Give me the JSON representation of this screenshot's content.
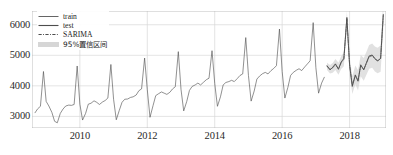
{
  "chart_data": {
    "type": "line",
    "title": "",
    "xlabel": "",
    "ylabel": "",
    "xlim": [
      2008.58,
      2019.08
    ],
    "ylim": [
      2620,
      6450
    ],
    "yticks": [
      3000,
      4000,
      5000,
      6000
    ],
    "ytick_labels": [
      "3000",
      "4000",
      "5000",
      "6000"
    ],
    "xticks": [
      2010,
      2012,
      2014,
      2016,
      2018
    ],
    "xtick_labels": [
      "2010",
      "2012",
      "2014",
      "2016",
      "2018"
    ],
    "grid": true,
    "legend_position": "upper left",
    "legend": [
      {
        "name": "train",
        "style": "solid",
        "color": "#4d4d4d"
      },
      {
        "name": "test",
        "style": "solid-thick",
        "color": "#4d4d4d"
      },
      {
        "name": "SARIMA",
        "style": "dash-dot",
        "color": "#4d4d4d"
      },
      {
        "name": "95%置信区间",
        "style": "band",
        "color": "#c8c8c8"
      }
    ],
    "series": [
      {
        "name": "train",
        "style": "solid",
        "color": "#4d4d4d",
        "x": [
          2008.67,
          2008.75,
          2008.83,
          2008.92,
          2009.0,
          2009.08,
          2009.17,
          2009.25,
          2009.33,
          2009.42,
          2009.5,
          2009.58,
          2009.67,
          2009.75,
          2009.83,
          2009.92,
          2010.0,
          2010.08,
          2010.17,
          2010.25,
          2010.33,
          2010.42,
          2010.5,
          2010.58,
          2010.67,
          2010.75,
          2010.83,
          2010.92,
          2011.0,
          2011.08,
          2011.17,
          2011.25,
          2011.33,
          2011.42,
          2011.5,
          2011.58,
          2011.67,
          2011.75,
          2011.83,
          2011.92,
          2012.0,
          2012.08,
          2012.17,
          2012.25,
          2012.33,
          2012.42,
          2012.5,
          2012.58,
          2012.67,
          2012.75,
          2012.83,
          2012.92,
          2013.0,
          2013.08,
          2013.17,
          2013.25,
          2013.33,
          2013.42,
          2013.5,
          2013.58,
          2013.67,
          2013.75,
          2013.83,
          2013.92,
          2014.0,
          2014.08,
          2014.17,
          2014.25,
          2014.33,
          2014.42,
          2014.5,
          2014.58,
          2014.67,
          2014.75,
          2014.83,
          2014.92,
          2015.0,
          2015.08,
          2015.17,
          2015.25,
          2015.33,
          2015.42,
          2015.5,
          2015.58,
          2015.67,
          2015.75,
          2015.83,
          2015.92,
          2016.0,
          2016.08,
          2016.17,
          2016.25,
          2016.33,
          2016.42,
          2016.5,
          2016.58,
          2016.67,
          2016.75,
          2016.83,
          2016.92,
          2017.0,
          2017.08,
          2017.17,
          2017.25
        ],
        "y": [
          3120,
          3250,
          3330,
          4470,
          3490,
          3340,
          3130,
          2840,
          2790,
          3100,
          3240,
          3340,
          3370,
          3360,
          3390,
          4650,
          3400,
          2880,
          3100,
          3400,
          3430,
          3510,
          3460,
          3390,
          3470,
          3520,
          3600,
          4700,
          3560,
          2890,
          3200,
          3460,
          3560,
          3570,
          3620,
          3640,
          3700,
          3840,
          3900,
          4910,
          3870,
          2970,
          3350,
          3680,
          3740,
          3800,
          3760,
          3720,
          3790,
          3900,
          3970,
          5120,
          3880,
          3180,
          3490,
          3850,
          3980,
          4030,
          4090,
          4030,
          4120,
          4200,
          4250,
          5150,
          4080,
          3330,
          3640,
          4030,
          4110,
          4140,
          4180,
          4140,
          4240,
          4340,
          4390,
          5580,
          4340,
          3500,
          3830,
          4220,
          4320,
          4400,
          4440,
          4390,
          4500,
          4570,
          4660,
          5860,
          4470,
          3600,
          3950,
          4340,
          4440,
          4510,
          4560,
          4500,
          4620,
          4720,
          4820,
          6070,
          4600,
          3760,
          4090,
          4280
        ]
      },
      {
        "name": "test",
        "style": "solid-thick",
        "color": "#4d4d4d",
        "x": [
          2017.33,
          2017.42,
          2017.5,
          2017.58,
          2017.67,
          2017.75,
          2017.83,
          2017.92,
          2018.0,
          2018.08,
          2018.17,
          2018.25,
          2018.33,
          2018.42,
          2018.5,
          2018.58,
          2018.67,
          2018.75,
          2018.83,
          2018.92,
          2019.0
        ],
        "y": [
          4660,
          4520,
          4610,
          4720,
          4540,
          4780,
          4900,
          6240,
          4680,
          3980,
          4340,
          4150,
          4690,
          4520,
          4760,
          4980,
          5010,
          4900,
          4810,
          4900,
          6340
        ]
      },
      {
        "name": "SARIMA",
        "style": "dash-dot",
        "color": "#4d4d4d",
        "x": [
          2017.33,
          2017.42,
          2017.5,
          2017.58,
          2017.67,
          2017.75,
          2017.83,
          2017.92,
          2018.0,
          2018.08,
          2018.17,
          2018.25,
          2018.33,
          2018.42,
          2018.5,
          2018.58,
          2018.67,
          2018.75,
          2018.83,
          2018.92,
          2019.0
        ],
        "y": [
          4640,
          4540,
          4590,
          4700,
          4560,
          4760,
          4870,
          6200,
          4700,
          4020,
          4360,
          4180,
          4660,
          4540,
          4740,
          4950,
          4990,
          4880,
          4830,
          4890,
          6300
        ]
      },
      {
        "name": "95%置信区间",
        "style": "band",
        "color": "#c8c8c8",
        "x": [
          2017.33,
          2017.42,
          2017.5,
          2017.58,
          2017.67,
          2017.75,
          2017.83,
          2017.92,
          2018.0,
          2018.08,
          2018.17,
          2018.25,
          2018.33,
          2018.42,
          2018.5,
          2018.58,
          2018.67,
          2018.75,
          2018.83,
          2018.92,
          2019.0
        ],
        "lower": [
          4520,
          4400,
          4430,
          4520,
          4360,
          4550,
          4640,
          5960,
          4430,
          3730,
          4050,
          3850,
          4310,
          4170,
          4360,
          4560,
          4590,
          4470,
          4410,
          4460,
          5860
        ],
        "upper": [
          4760,
          4680,
          4750,
          4880,
          4760,
          4970,
          5100,
          6440,
          4970,
          4310,
          4670,
          4510,
          5010,
          4910,
          5120,
          5340,
          5390,
          5290,
          5250,
          5320,
          6740
        ]
      }
    ]
  }
}
